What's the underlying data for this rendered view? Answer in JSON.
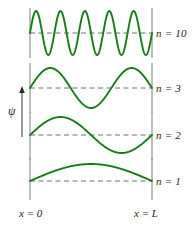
{
  "figure": {
    "colors": {
      "wave": "#1a7a1a",
      "wall": "#8a8a8a",
      "baseline": "#6e6e6e",
      "text": "#231f20",
      "background": "#ffffff"
    },
    "y_axis": {
      "symbol": "ψ",
      "arrow_direction": "up"
    },
    "x_axis": {
      "left_label": "x = 0",
      "right_label": "x = L"
    },
    "panels": [
      {
        "id": "panel-n10",
        "label": "n = 10",
        "n": 10,
        "half_wavelengths": 10,
        "cycles": 5,
        "baseline_y": 33,
        "amplitude": 22,
        "wall_top": 8,
        "wall_bottom": 58,
        "label_x": 156,
        "label_y": 28
      },
      {
        "id": "panel-n3",
        "label": "n = 3",
        "n": 3,
        "half_wavelengths": 3,
        "cycles": 1.5,
        "baseline_y": 88,
        "amplitude": 20,
        "wall_top": 63,
        "wall_bottom": 113,
        "label_x": 156,
        "label_y": 83
      },
      {
        "id": "panel-n2",
        "label": "n = 2",
        "n": 2,
        "half_wavelengths": 2,
        "cycles": 1,
        "baseline_y": 135,
        "amplitude": 18,
        "wall_top": 112,
        "wall_bottom": 160,
        "label_x": 156,
        "label_y": 130
      },
      {
        "id": "panel-n1",
        "label": "n = 1",
        "n": 1,
        "half_wavelengths": 1,
        "cycles": 0.5,
        "baseline_y": 181,
        "amplitude": 17,
        "wall_top": 158,
        "wall_bottom": 200,
        "label_x": 156,
        "label_y": 176
      }
    ],
    "geometry": {
      "x_left": 30,
      "x_right": 152
    },
    "psi_arrow": {
      "x": 22,
      "y_top": 86,
      "y_bottom": 137,
      "label_x": 8,
      "label_y": 105
    },
    "axis_labels": {
      "left_x": 19,
      "right_x": 134,
      "y": 208
    }
  },
  "chart_data": {
    "type": "line",
    "xlabel": "x",
    "ylabel": "ψ",
    "x": [
      0,
      1
    ],
    "xlim": [
      0,
      1
    ],
    "xtick_labels": [
      "x = 0",
      "x = L"
    ],
    "grid": false,
    "legend_position": "right",
    "series": [
      {
        "name": "n = 10",
        "n": 10,
        "formula": "psi(x) = A sin(10 pi x / L)",
        "nodes": 11,
        "antinodes": 10,
        "color": "#1a7a1a"
      },
      {
        "name": "n = 3",
        "n": 3,
        "formula": "psi(x) = A sin(3 pi x / L)",
        "nodes": 4,
        "antinodes": 3,
        "color": "#1a7a1a"
      },
      {
        "name": "n = 2",
        "n": 2,
        "formula": "psi(x) = A sin(2 pi x / L)",
        "nodes": 3,
        "antinodes": 2,
        "color": "#1a7a1a"
      },
      {
        "name": "n = 1",
        "n": 1,
        "formula": "psi(x) = A sin(pi x / L)",
        "nodes": 2,
        "antinodes": 1,
        "color": "#1a7a1a"
      }
    ],
    "annotations": [
      "n = 10",
      "n = 3",
      "n = 2",
      "n = 1",
      "x = 0",
      "x = L",
      "ψ"
    ]
  }
}
